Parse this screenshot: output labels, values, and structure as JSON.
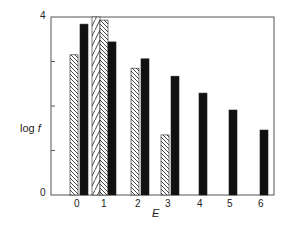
{
  "chart_data": {
    "type": "bar",
    "title": "",
    "xlabel": "E",
    "ylabel": "log f",
    "ylim": [
      0,
      4
    ],
    "y_ticks": [
      0,
      1,
      2,
      3,
      4
    ],
    "y_tick_labels_shown": [
      "0",
      "4"
    ],
    "categories": [
      "0",
      "1",
      "2",
      "3",
      "4",
      "5",
      "6"
    ],
    "grid": false,
    "legend": "none",
    "series": [
      {
        "name": "forward-hatched (///)",
        "pattern": "hatch-forward",
        "values": [
          null,
          4.0,
          null,
          null,
          null,
          null,
          null
        ]
      },
      {
        "name": "back-hatched (\\\\\\)",
        "pattern": "hatch-back",
        "values": [
          3.15,
          3.93,
          2.85,
          1.35,
          null,
          null,
          null
        ]
      },
      {
        "name": "solid black",
        "pattern": "solid",
        "values": [
          3.84,
          3.44,
          3.06,
          2.67,
          2.29,
          1.91,
          1.46
        ]
      }
    ]
  },
  "axes": {
    "x_label": "E",
    "y_label_main": "log ",
    "y_label_italic": "f",
    "y_tick_top": "4",
    "y_tick_bottom": "0",
    "x_ticks": [
      "0",
      "1",
      "2",
      "3",
      "4",
      "5",
      "6"
    ]
  }
}
